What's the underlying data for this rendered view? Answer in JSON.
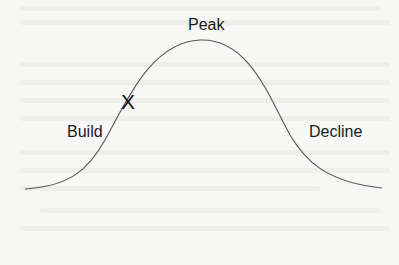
{
  "diagram": {
    "type": "bell-curve",
    "labels": {
      "peak": "Peak",
      "build": "Build",
      "decline": "Decline"
    },
    "marker": "X",
    "colors": {
      "background": "#f7f7f6",
      "curve": "#555555",
      "text": "#1a1a1a"
    }
  }
}
